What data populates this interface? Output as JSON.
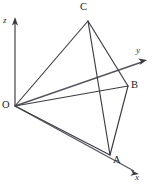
{
  "figure": {
    "background_color": "#ffffff",
    "line_color": "#3b3b44",
    "axis_color": "#55555e",
    "label_color": "#222228",
    "width": 152,
    "height": 186
  },
  "axes": [
    {
      "id": "z",
      "label": "z",
      "label_x": 3,
      "label_y": 16,
      "from_x": 15,
      "from_y": 106,
      "to_x": 15,
      "to_y": 22,
      "arrow": true
    },
    {
      "id": "y",
      "label": "y",
      "label_x": 136,
      "label_y": 46,
      "from_x": 15,
      "from_y": 106,
      "to_x": 142,
      "to_y": 62,
      "arrow": true
    },
    {
      "id": "x",
      "label": "x",
      "label_x": 135,
      "label_y": 173,
      "from_x": 15,
      "from_y": 106,
      "to_x": 134,
      "to_y": 171,
      "arrow": true
    }
  ],
  "vertices": [
    {
      "id": "O",
      "label": "O",
      "x": 15,
      "y": 106,
      "label_x": 2,
      "label_y": 100
    },
    {
      "id": "A",
      "label": "A",
      "x": 110,
      "y": 155,
      "label_x": 113,
      "label_y": 155
    },
    {
      "id": "B",
      "label": "B",
      "x": 128,
      "y": 86,
      "label_x": 131,
      "label_y": 80
    },
    {
      "id": "C",
      "label": "C",
      "x": 88,
      "y": 21,
      "label_x": 80,
      "label_y": 2
    }
  ],
  "edges": [
    {
      "id": "OC",
      "from": "O",
      "to": "C"
    },
    {
      "id": "OB",
      "from": "O",
      "to": "B"
    },
    {
      "id": "OA",
      "from": "O",
      "to": "A"
    },
    {
      "id": "CA",
      "from": "C",
      "to": "A"
    },
    {
      "id": "CB",
      "from": "C",
      "to": "B"
    },
    {
      "id": "AB",
      "from": "A",
      "to": "B"
    }
  ]
}
